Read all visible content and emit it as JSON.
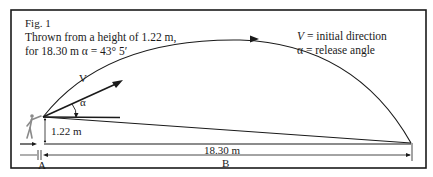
{
  "figure": {
    "label": "Fig. 1",
    "caption_line1": "Thrown from a height of 1.22 m,",
    "caption_line2": "for 18.30 m α = 43° 5′"
  },
  "legend": {
    "v_symbol": "V",
    "v_text": " = initial direction",
    "alpha_symbol": "α",
    "alpha_text": " = release angle"
  },
  "annotations": {
    "velocity_label": "V",
    "angle_label": "α",
    "release_height": "1.22 m",
    "throw_distance": "18.30 m",
    "point_a": "A",
    "point_b": "B"
  },
  "values": {
    "release_height_m": 1.22,
    "distance_m": 18.3,
    "release_angle": "43° 5′"
  },
  "colors": {
    "ink": "#1a1a1a",
    "background": "#ffffff",
    "figure_gray": "#8a8a8a"
  }
}
